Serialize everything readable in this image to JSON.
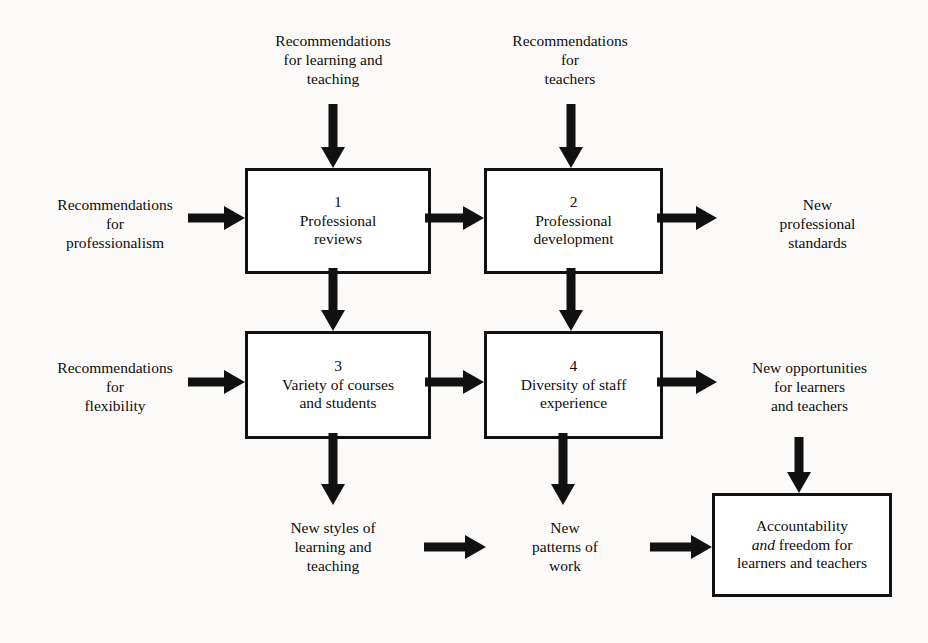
{
  "diagram": {
    "background_color": "#fbfaf8",
    "ink_color": "#111111",
    "nodes": [
      {
        "number": "1",
        "title_line1": "Professional",
        "title_line2": "reviews"
      },
      {
        "number": "2",
        "title_line1": "Professional",
        "title_line2": "development"
      },
      {
        "number": "3",
        "title_line1": "Variety of courses",
        "title_line2": "and students"
      },
      {
        "number": "4",
        "title_line1": "Diversity of staff",
        "title_line2": "experience"
      }
    ],
    "outcome_box": {
      "line1": "Accountability",
      "line2_italic": "and",
      "line2_rest": " freedom for",
      "line3": "learners and teachers"
    },
    "captions": {
      "top_left": "Recommendations\nfor learning and\nteaching",
      "top_right": "Recommendations\nfor\nteachers",
      "left_upper": "Recommendations\nfor\nprofessionalism",
      "left_lower": "Recommendations\nfor\nflexibility",
      "right_upper": "New\nprofessional\nstandards",
      "right_lower": "New opportunities\nfor learners\nand teachers",
      "bottom_left": "New styles of\nlearning and\nteaching",
      "bottom_mid": "New\npatterns of\nwork"
    },
    "arrows": [
      {
        "name": "arrow-into-box1-top",
        "direction": "down"
      },
      {
        "name": "arrow-into-box2-top",
        "direction": "down"
      },
      {
        "name": "arrow-into-box1-left",
        "direction": "right"
      },
      {
        "name": "arrow-box1-to-box2",
        "direction": "right"
      },
      {
        "name": "arrow-box2-to-standards",
        "direction": "right"
      },
      {
        "name": "arrow-box1-to-box3",
        "direction": "down"
      },
      {
        "name": "arrow-box2-to-box4",
        "direction": "down"
      },
      {
        "name": "arrow-into-box3-left",
        "direction": "right"
      },
      {
        "name": "arrow-box3-to-box4",
        "direction": "right"
      },
      {
        "name": "arrow-box4-to-opportunities",
        "direction": "right"
      },
      {
        "name": "arrow-box3-to-new-styles",
        "direction": "down"
      },
      {
        "name": "arrow-box4-to-new-patterns",
        "direction": "down"
      },
      {
        "name": "arrow-opportunities-to-accountability",
        "direction": "down"
      },
      {
        "name": "arrow-new-styles-to-new-patterns",
        "direction": "right"
      },
      {
        "name": "arrow-new-patterns-to-accountability",
        "direction": "right"
      }
    ]
  }
}
